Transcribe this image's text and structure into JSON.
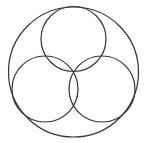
{
  "diagram": {
    "background": "#ffffff",
    "stroke_color": "#333333",
    "stroke_width": 1.2,
    "circles": [
      {
        "name": "outer-circle",
        "cx": 73.5,
        "cy": 72,
        "r": 65
      },
      {
        "name": "top-circle",
        "cx": 73.5,
        "cy": 39,
        "r": 32.5
      },
      {
        "name": "lower-left-circle",
        "cx": 45,
        "cy": 89,
        "r": 33
      },
      {
        "name": "lower-right-circle",
        "cx": 102,
        "cy": 89,
        "r": 33
      }
    ]
  }
}
